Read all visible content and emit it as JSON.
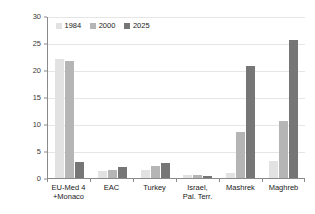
{
  "chart_data": {
    "type": "bar",
    "title": "",
    "xlabel": "",
    "ylabel": "Nb of road deaths in thousands",
    "ylim": [
      0,
      30
    ],
    "yticks": [
      "0",
      "5",
      "10",
      "15",
      "20",
      "25",
      "30"
    ],
    "grid": true,
    "legend_position": "top-left-inside",
    "categories": [
      "EU-Med 4 +Monaco",
      "EAC",
      "Turkey",
      "Israel, Pal. Terr.",
      "Mashrek",
      "Maghreb"
    ],
    "category_lines": [
      {
        "line1": "EU-Med 4",
        "line2": "+Monaco"
      },
      {
        "line1": "EAC",
        "line2": ""
      },
      {
        "line1": "Turkey",
        "line2": ""
      },
      {
        "line1": "Israel,",
        "line2": "Pal. Terr."
      },
      {
        "line1": "Mashrek",
        "line2": ""
      },
      {
        "line1": "Maghreb",
        "line2": ""
      }
    ],
    "series": [
      {
        "name": "1984",
        "color": "#e2e2e2",
        "values": [
          22.0,
          1.3,
          1.4,
          0.5,
          1.0,
          3.2
        ]
      },
      {
        "name": "2000",
        "color": "#b5b5b5",
        "values": [
          21.7,
          1.4,
          2.2,
          0.5,
          8.6,
          10.6
        ]
      },
      {
        "name": "2025",
        "color": "#767676",
        "values": [
          3.0,
          2.0,
          2.8,
          0.4,
          20.8,
          25.6
        ]
      }
    ]
  },
  "axis": {
    "y_title": "Nb of road deaths in thousands"
  },
  "colors": {
    "axis": "#8a8a8a",
    "grid": "#e6e6e6",
    "text": "#1a1a1a",
    "series_1984": "#e2e2e2",
    "series_2000": "#b5b5b5",
    "series_2025": "#767676"
  }
}
